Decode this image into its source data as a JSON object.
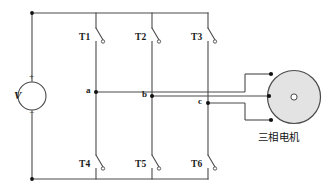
{
  "diagram": {
    "colors": {
      "wire": "#4a4a4a",
      "node": "#111111",
      "motor_fill": "#e3e3e3",
      "background": "#ffffff",
      "text": "#1a1a1a"
    }
  },
  "source": {
    "symbol_label": "V",
    "plus_sign": "+",
    "minus_sign": "−"
  },
  "switches": {
    "upper": [
      {
        "id": "T1",
        "label": "T1"
      },
      {
        "id": "T2",
        "label": "T2"
      },
      {
        "id": "T3",
        "label": "T3"
      }
    ],
    "lower": [
      {
        "id": "T4",
        "label": "T4"
      },
      {
        "id": "T5",
        "label": "T5"
      },
      {
        "id": "T6",
        "label": "T6"
      }
    ]
  },
  "nodes": [
    {
      "id": "a",
      "label": "a"
    },
    {
      "id": "b",
      "label": "b"
    },
    {
      "id": "c",
      "label": "c"
    }
  ],
  "motor": {
    "label": "三相电机",
    "phase_count": 3
  }
}
